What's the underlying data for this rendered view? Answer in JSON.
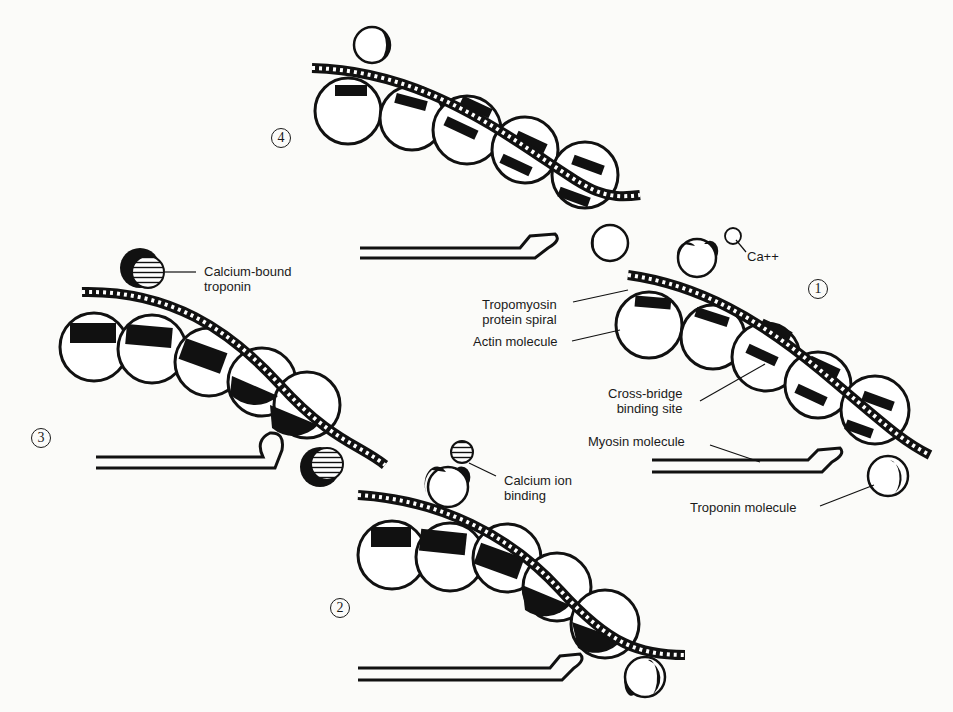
{
  "figure": {
    "colors": {
      "ink": "#111111",
      "paper": "#fbfbf9"
    },
    "steps": [
      {
        "id": "1",
        "label": "1"
      },
      {
        "id": "2",
        "label": "2"
      },
      {
        "id": "3",
        "label": "3"
      },
      {
        "id": "4",
        "label": "4"
      }
    ],
    "labels": {
      "ca": "Ca++",
      "tropomyosin": "Tropomyosin\nprotein spiral",
      "actin": "Actin molecule",
      "cross_bridge": "Cross-bridge\nbinding site",
      "myosin": "Myosin molecule",
      "troponin": "Troponin molecule",
      "calcium_ion_binding": "Calcium ion\nbinding",
      "calcium_bound_troponin": "Calcium-bound\ntroponin"
    }
  }
}
